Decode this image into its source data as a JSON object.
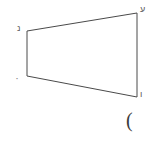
{
  "figure": {
    "type": "quadrilateral",
    "shape_name": "trapezoid",
    "background_color": "#ffffff",
    "stroke_color": "#4a4a4a",
    "stroke_width": 1,
    "vertices": [
      {
        "id": "top-left",
        "x": 27,
        "y": 31,
        "label": "נ"
      },
      {
        "id": "top-right",
        "x": 137,
        "y": 13,
        "label": "ע"
      },
      {
        "id": "bottom-right",
        "x": 137,
        "y": 97,
        "label": "ו"
      },
      {
        "id": "bottom-left",
        "x": 27,
        "y": 76,
        "label": "ָ"
      }
    ],
    "edges": [
      {
        "id": "top-edge",
        "from": "top-left",
        "to": "top-right"
      },
      {
        "id": "right-edge",
        "from": "top-right",
        "to": "bottom-right"
      },
      {
        "id": "bottom-edge",
        "from": "bottom-right",
        "to": "bottom-left"
      },
      {
        "id": "left-edge",
        "from": "bottom-left",
        "to": "top-left"
      }
    ]
  },
  "annotations": {
    "paren_mark": "("
  }
}
